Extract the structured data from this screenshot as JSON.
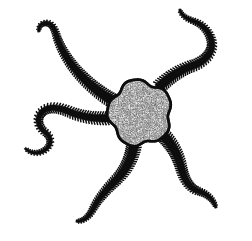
{
  "figure": {
    "subject_name": "brittle-star",
    "alt_text": "Black and white line drawing of a brittle star with a stippled central disc and five spiny sinuous arms",
    "background_color": "#ffffff",
    "ink_color": "#0d0d0d",
    "disc_fill_color": "#b4b4b4",
    "disc_speckle_color": "#1a1a1a",
    "canvas": {
      "width": 252,
      "height": 241
    },
    "disc": {
      "name": "central-disc",
      "center_x": 140,
      "center_y": 113,
      "radius_x": 31,
      "radius_y": 32,
      "lobes": 5,
      "texture": "stippled-granular"
    },
    "arms": [
      {
        "name": "arm-upper-left",
        "label": "Upper left arm",
        "path": "M 117 103 C 103 96 88 84 76 70 C 66 58 59 45 56 34 C 54 27 51 23 46 23 C 41 23 38 27 39 32",
        "base_width": 9.5,
        "tip_width": 2.4,
        "spine_count": 54
      },
      {
        "name": "arm-upper-right",
        "label": "Upper right arm",
        "path": "M 158 88 C 168 78 180 70 192 66 C 204 62 212 54 212 44 C 211 33 203 24 193 21 C 185 18 180 14 180 9",
        "base_width": 9.0,
        "tip_width": 2.3,
        "spine_count": 50
      },
      {
        "name": "arm-left",
        "label": "Left arm",
        "path": "M 110 118 C 96 119 82 117 70 112 C 58 107 48 106 42 112 C 36 118 38 127 45 132 C 52 137 52 145 45 150 C 38 155 29 153 25 148",
        "base_width": 7.6,
        "tip_width": 2.2,
        "spine_count": 52
      },
      {
        "name": "arm-lower-left",
        "label": "Lower left arm",
        "path": "M 134 145 C 132 158 126 170 117 179 C 107 189 98 199 93 209 C 89 217 83 222 76 221",
        "base_width": 9.2,
        "tip_width": 2.4,
        "spine_count": 44
      },
      {
        "name": "arm-lower-right",
        "label": "Lower right arm",
        "path": "M 163 135 C 172 144 178 155 181 167 C 184 179 189 188 198 191 C 208 194 214 200 216 208",
        "base_width": 9.4,
        "tip_width": 2.4,
        "spine_count": 42
      }
    ]
  }
}
